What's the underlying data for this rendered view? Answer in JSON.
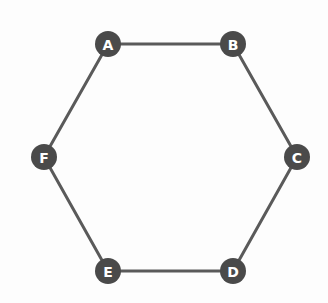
{
  "graph": {
    "title": "Hexagonal cycle graph",
    "background_color": "#fdfdfd",
    "node_fill_color": "#4a4a4a",
    "node_label_color": "#ffffff",
    "edge_color": "#5a5a5a",
    "edge_width": 3,
    "node_radius": 13,
    "nodes": [
      {
        "id": "A",
        "label": "A",
        "x": 108,
        "y": 44
      },
      {
        "id": "B",
        "label": "B",
        "x": 233,
        "y": 44
      },
      {
        "id": "C",
        "label": "C",
        "x": 297,
        "y": 157
      },
      {
        "id": "D",
        "label": "D",
        "x": 233,
        "y": 271
      },
      {
        "id": "E",
        "label": "E",
        "x": 108,
        "y": 271
      },
      {
        "id": "F",
        "label": "F",
        "x": 44,
        "y": 157
      }
    ],
    "edges": [
      {
        "from": "A",
        "to": "B"
      },
      {
        "from": "B",
        "to": "C"
      },
      {
        "from": "C",
        "to": "D"
      },
      {
        "from": "D",
        "to": "E"
      },
      {
        "from": "E",
        "to": "F"
      },
      {
        "from": "F",
        "to": "A"
      }
    ]
  }
}
